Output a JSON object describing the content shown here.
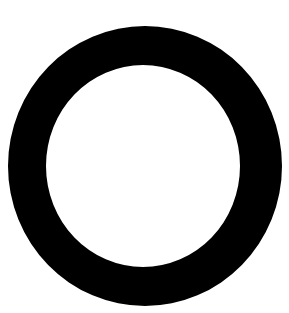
{
  "shape": {
    "type": "ring",
    "color": "#000000",
    "background": "#ffffff",
    "outer": {
      "cx": 145,
      "cy": 166,
      "rx": 137,
      "ry": 140
    },
    "inner": {
      "cx": 143,
      "cy": 166,
      "rx": 97,
      "ry": 101
    }
  }
}
